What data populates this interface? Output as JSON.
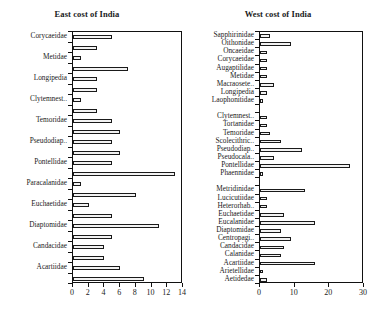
{
  "figure": {
    "type": "grouped-bar-figure",
    "panel_count": 2
  },
  "chart_data": [
    {
      "type": "bar",
      "orientation": "horizontal",
      "title": "East cost of India",
      "xlabel": "",
      "ylabel": "",
      "xlim": [
        0,
        14
      ],
      "xticks": [
        0,
        2,
        4,
        6,
        8,
        10,
        12,
        14
      ],
      "xtick_labels": [
        "0",
        "2",
        "4",
        "6",
        "8",
        "10",
        "12",
        "14"
      ],
      "grid": false,
      "legend": "none",
      "label_every_other_tick": true,
      "categories": [
        "Corycaeidae",
        "",
        "Metidae",
        "",
        "Longipedia",
        "",
        "Clytemnest..",
        "",
        "Temoridae",
        "",
        "Pseudodiap..",
        "",
        "Pontellidae",
        "",
        "Paracalanidae",
        "",
        "Euchaetidae",
        "",
        "Diaptomidae",
        "",
        "Candacidae",
        "",
        "Acartiidae",
        ""
      ],
      "visible_labels": [
        "Corycaeidae",
        "Metidae",
        "Longipedia",
        "Clytemnest..",
        "Temoridae",
        "Pseudodiap..",
        "Pontellidae",
        "Paracalanidae",
        "Euchaetidae",
        "Diaptomidae",
        "Candacidae",
        "Acartiidae"
      ],
      "values": [
        5,
        3,
        1,
        7,
        3,
        3,
        1,
        3,
        5,
        6,
        5,
        6,
        5,
        13,
        1,
        8,
        2,
        5,
        11,
        5,
        4,
        4,
        6,
        9
      ]
    },
    {
      "type": "bar",
      "orientation": "horizontal",
      "title": "West cost of India",
      "xlabel": "",
      "ylabel": "",
      "xlim": [
        0,
        30
      ],
      "xticks": [
        0,
        10,
        20,
        30
      ],
      "xtick_labels": [
        "0",
        "10",
        "20",
        "30"
      ],
      "grid": false,
      "legend": "none",
      "label_every_other_tick": false,
      "categories": [
        "Sapphirinidae",
        "Oithonidae",
        "Oncaeidae",
        "Corycaeidae",
        "Augaptilidae",
        "Metidae",
        "Macraosete..",
        "Longipedia",
        "Laophonitidae",
        "",
        "Clytemnest..",
        "Tortanidae",
        "Temoridae",
        "Scolecithric..",
        "Pseudodiap..",
        "Pseudocala..",
        "Pontellidae",
        "Phaennidae",
        "",
        "Metridinidae",
        "Lucicutiidae",
        "Heterorhab..",
        "Euchaetidae",
        "Eucalanidae",
        "Diaptomidae",
        "Centropagi..",
        "Candacidae",
        "Calanidae",
        "Acartiidae",
        "Arietellidae",
        "Aetidedae"
      ],
      "values": [
        3,
        9,
        2,
        2,
        2,
        2,
        4,
        2,
        1,
        0,
        2,
        2,
        3,
        6,
        12,
        4,
        26,
        1,
        0,
        13,
        2,
        2,
        7,
        16,
        6,
        9,
        7,
        6,
        16,
        1,
        2
      ]
    }
  ]
}
